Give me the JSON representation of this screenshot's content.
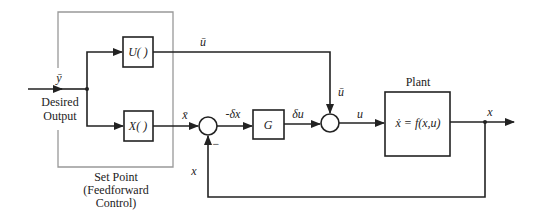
{
  "diagram": {
    "input": {
      "signal": "ȳ",
      "label_line1": "Desired",
      "label_line2": "Output"
    },
    "setpoint_group": {
      "label_line1": "Set Point",
      "label_line2": "(Feedforward",
      "label_line3": "Control)"
    },
    "blocks": {
      "u_block": "U( )",
      "x_block": "X( )",
      "gain": "G",
      "plant_title": "Plant",
      "plant_eq": "ẋ = f(x,u)"
    },
    "signals": {
      "u_bar_top": "ū",
      "u_bar_down": "ū",
      "x_bar": "x̄",
      "neg_delta_x": "-δx",
      "delta_u": "δu",
      "u": "u",
      "x_out": "x",
      "x_feedback": "x",
      "minus_sign": "−"
    }
  }
}
